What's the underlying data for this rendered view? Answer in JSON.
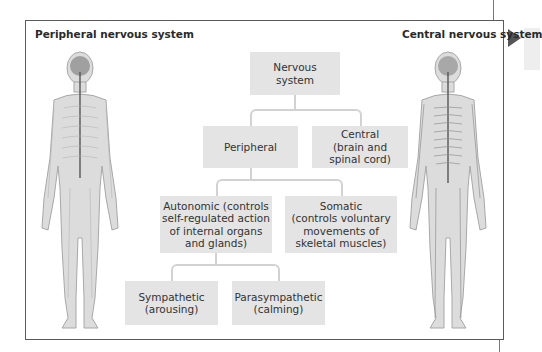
{
  "diagram": {
    "type": "hierarchy",
    "left_label": "Peripheral nervous system",
    "right_label": "Central nervous system",
    "nodes": {
      "root": "Nervous\nsystem",
      "peripheral": "Peripheral",
      "central": "Central\n(brain and\nspinal cord)",
      "autonomic": "Autonomic (controls\nself-regulated action\nof internal organs\nand glands)",
      "somatic": "Somatic\n(controls voluntary\nmovements of\nskeletal muscles)",
      "sympathetic": "Sympathetic\n(arousing)",
      "parasympathetic": "Parasympathetic\n(calming)"
    },
    "edges": [
      [
        "Nervous system",
        "Peripheral"
      ],
      [
        "Nervous system",
        "Central"
      ],
      [
        "Peripheral",
        "Autonomic"
      ],
      [
        "Peripheral",
        "Somatic"
      ],
      [
        "Autonomic",
        "Sympathetic"
      ],
      [
        "Autonomic",
        "Parasympathetic"
      ]
    ],
    "illustrations": [
      {
        "side": "left",
        "depicts": "human-figure-peripheral-nervous-system"
      },
      {
        "side": "right",
        "depicts": "human-figure-central-nervous-system"
      }
    ],
    "colors": {
      "box_fill": "#e4e4e4",
      "connector": "#d2d2d2",
      "frame_border": "#5a5a5a",
      "arrow": "#555555"
    }
  }
}
